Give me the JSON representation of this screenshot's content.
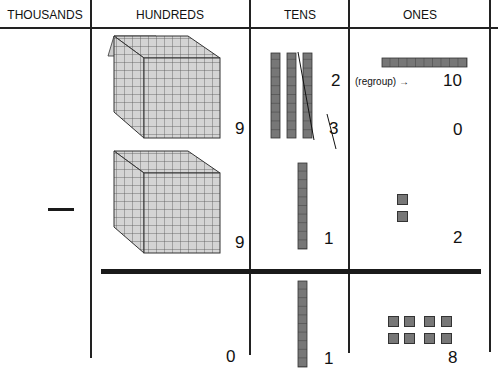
{
  "headers": {
    "thousands": "THOUSANDS",
    "hundreds": "HUNDREDS",
    "tens": "TENS",
    "ones": "ONES"
  },
  "operator": "minus",
  "minuend": {
    "hundreds": "9",
    "tens_crossed": "3",
    "tens_new": "2",
    "ones_crossed": "0",
    "ones_new": "10",
    "regroup_label": "(regroup) →"
  },
  "subtrahend": {
    "hundreds": "9",
    "tens": "1",
    "ones": "2"
  },
  "difference": {
    "hundreds": "0",
    "tens": "1",
    "ones": "8"
  },
  "colors": {
    "line": "#222222",
    "rod_fill": "#777777",
    "cube_fill": "#d4d4d4",
    "cube_grid": "#444444"
  }
}
